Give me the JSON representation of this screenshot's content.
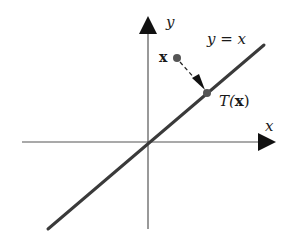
{
  "diagram": {
    "axes": {
      "x_label": "x",
      "y_label": "y"
    },
    "line_label": "y = x",
    "point_label": "x",
    "image_label_prefix": "T(",
    "image_label_arg": "x",
    "image_label_suffix": ")",
    "colors": {
      "axis": "#555555",
      "line": "#3a3a3a",
      "point": "#555555",
      "arrow": "#111111"
    }
  }
}
